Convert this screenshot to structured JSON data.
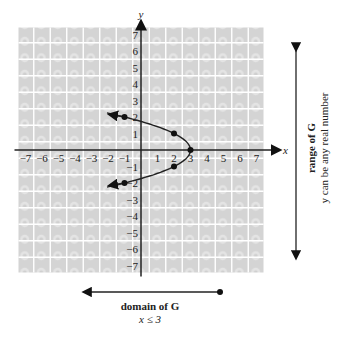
{
  "chart_data": {
    "type": "line",
    "title": "",
    "xlabel": "x",
    "ylabel": "y",
    "xlim": [
      -7,
      7
    ],
    "ylim": [
      -7,
      7
    ],
    "grid": true,
    "x_ticks": [
      -7,
      -6,
      -5,
      -4,
      -3,
      -2,
      -1,
      1,
      2,
      3,
      4,
      5,
      6,
      7
    ],
    "y_ticks": [
      -7,
      -6,
      -5,
      -4,
      -3,
      -2,
      -1,
      1,
      2,
      3,
      4,
      5,
      6,
      7
    ],
    "series": [
      {
        "name": "G",
        "equation": "x = 3 - y^2",
        "points": [
          {
            "x": -1,
            "y": 2
          },
          {
            "x": 2,
            "y": 1
          },
          {
            "x": 3,
            "y": 0
          },
          {
            "x": 2,
            "y": -1
          },
          {
            "x": -1,
            "y": -2
          }
        ],
        "arrows": "both ends continue left"
      }
    ],
    "annotations": [
      {
        "type": "range",
        "title": "range of G",
        "text": "y can be any real number",
        "orientation": "vertical",
        "arrows": "both"
      },
      {
        "type": "domain",
        "title": "domain of G",
        "text": "x ≤ 3",
        "orientation": "horizontal",
        "endpoint": "closed dot at right, arrow left"
      }
    ]
  },
  "labels": {
    "x_axis": "x",
    "y_axis": "y",
    "range_title": "range of G",
    "range_text": "y can be any real number",
    "domain_title": "domain of G",
    "domain_text": "x ≤ 3"
  }
}
